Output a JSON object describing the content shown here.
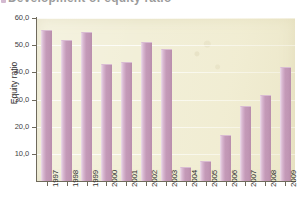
{
  "title": {
    "text": "Development of equity ratio",
    "visible_note": "cropped at top edge"
  },
  "axis": {
    "y_title": "Equity ratio",
    "y_ticks": [
      "10,0",
      "20,0",
      "30,0",
      "40,0",
      "50,0",
      "60,0"
    ]
  },
  "colors": {
    "bar": "#c49ab8",
    "bar_highlight": "#e3cbdd",
    "plot_background": "#f2efd8",
    "axis": "#6f6a5c",
    "text": "#2e2e2e",
    "page_background": "#ffffff"
  },
  "chart_data": {
    "type": "bar",
    "title": "Development of equity ratio",
    "xlabel": "",
    "ylabel": "Equity ratio",
    "ylim": [
      0,
      60
    ],
    "ytick_step": 10,
    "grid": true,
    "legend": "none",
    "decimal_separator": ",",
    "categories": [
      "1997",
      "1998",
      "1999",
      "2000",
      "2001",
      "2002",
      "2003",
      "2004",
      "2005",
      "2006",
      "2007",
      "2008",
      "2009"
    ],
    "values": [
      55.5,
      51.8,
      54.8,
      43.2,
      43.7,
      51.3,
      48.5,
      5.0,
      7.5,
      17.0,
      27.5,
      31.5,
      41.8
    ]
  }
}
